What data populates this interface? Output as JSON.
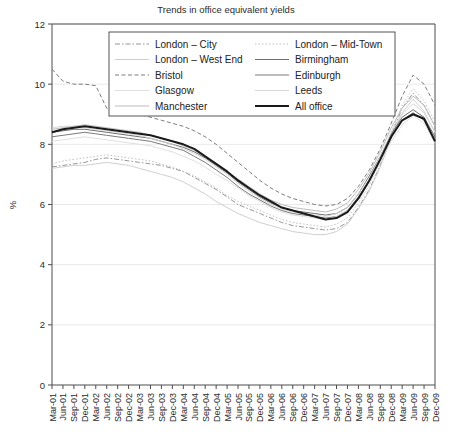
{
  "chart_data": {
    "type": "line",
    "title": "Trends in office equivalent yields",
    "xlabel": "",
    "ylabel": "%",
    "ylim": [
      0,
      12
    ],
    "yticks": [
      0,
      2,
      4,
      6,
      8,
      10,
      12
    ],
    "grid": true,
    "legend_position": "top-center",
    "categories": [
      "Mar-01",
      "Jun-01",
      "Sep-01",
      "Dec-01",
      "Mar-02",
      "Jun-02",
      "Sep-02",
      "Dec-02",
      "Mar-03",
      "Jun-03",
      "Sep-03",
      "Dec-03",
      "Mar-04",
      "Jun-04",
      "Sep-04",
      "Dec-04",
      "Mar-05",
      "Jun-05",
      "Sep-05",
      "Dec-05",
      "Mar-06",
      "Jun-06",
      "Sep-06",
      "Dec-06",
      "Mar-07",
      "Jun-07",
      "Sep-07",
      "Dec-07",
      "Mar-08",
      "Jun-08",
      "Sep-08",
      "Dec-08",
      "Mar-09",
      "Jun-09",
      "Sep-09",
      "Dec-09"
    ],
    "series": [
      {
        "name": "London – City",
        "style": "dashdot",
        "color": "#8a8a8a",
        "width": 0.9,
        "values": [
          7.25,
          7.3,
          7.35,
          7.4,
          7.5,
          7.55,
          7.5,
          7.45,
          7.4,
          7.35,
          7.3,
          7.2,
          7.1,
          6.9,
          6.7,
          6.5,
          6.25,
          6.0,
          5.85,
          5.7,
          5.55,
          5.4,
          5.3,
          5.25,
          5.2,
          5.15,
          5.2,
          5.4,
          5.9,
          6.5,
          7.3,
          8.3,
          9.2,
          9.7,
          9.3,
          8.6
        ]
      },
      {
        "name": "London – Mid-Town",
        "style": "dotted",
        "color": "#b8b8b8",
        "width": 0.9,
        "values": [
          7.35,
          7.45,
          7.5,
          7.55,
          7.6,
          7.65,
          7.6,
          7.55,
          7.5,
          7.45,
          7.35,
          7.25,
          7.1,
          6.95,
          6.75,
          6.55,
          6.3,
          6.1,
          5.95,
          5.8,
          5.65,
          5.5,
          5.4,
          5.35,
          5.3,
          5.25,
          5.35,
          5.55,
          6.05,
          6.65,
          7.45,
          8.4,
          9.3,
          9.85,
          9.45,
          8.75
        ]
      },
      {
        "name": "London – West End",
        "style": "solid",
        "color": "#c9c9c9",
        "width": 0.9,
        "values": [
          7.2,
          7.25,
          7.3,
          7.3,
          7.35,
          7.4,
          7.35,
          7.3,
          7.2,
          7.1,
          7.0,
          6.9,
          6.75,
          6.55,
          6.35,
          6.1,
          5.9,
          5.7,
          5.55,
          5.4,
          5.3,
          5.2,
          5.1,
          5.05,
          5.0,
          5.0,
          5.1,
          5.35,
          5.85,
          6.45,
          7.25,
          8.2,
          9.05,
          9.5,
          9.1,
          8.4
        ]
      },
      {
        "name": "Birmingham",
        "style": "solid",
        "color": "#6e6e6e",
        "width": 1.0,
        "values": [
          8.4,
          8.45,
          8.5,
          8.5,
          8.45,
          8.4,
          8.35,
          8.3,
          8.25,
          8.2,
          8.1,
          8.0,
          7.9,
          7.75,
          7.55,
          7.3,
          7.05,
          6.75,
          6.5,
          6.25,
          6.05,
          5.9,
          5.8,
          5.75,
          5.7,
          5.65,
          5.7,
          5.9,
          6.35,
          6.95,
          7.6,
          8.35,
          8.9,
          9.15,
          8.9,
          8.25
        ]
      },
      {
        "name": "Bristol",
        "style": "dashed",
        "color": "#7d7d7d",
        "width": 1.0,
        "values": [
          10.5,
          10.1,
          10.0,
          10.0,
          9.95,
          9.2,
          9.1,
          9.05,
          9.0,
          8.9,
          8.8,
          8.7,
          8.6,
          8.45,
          8.25,
          8.0,
          7.7,
          7.4,
          7.1,
          6.8,
          6.55,
          6.35,
          6.2,
          6.1,
          6.0,
          5.95,
          6.0,
          6.2,
          6.6,
          7.15,
          7.85,
          8.7,
          9.6,
          10.3,
          10.0,
          9.3
        ]
      },
      {
        "name": "Edinburgh",
        "style": "solid",
        "color": "#7a7a7a",
        "width": 1.0,
        "values": [
          8.25,
          8.3,
          8.35,
          8.4,
          8.35,
          8.3,
          8.25,
          8.2,
          8.15,
          8.1,
          8.0,
          7.9,
          7.8,
          7.6,
          7.4,
          7.15,
          6.9,
          6.6,
          6.35,
          6.15,
          5.95,
          5.8,
          5.7,
          5.65,
          5.6,
          5.55,
          5.6,
          5.8,
          6.25,
          6.8,
          7.5,
          8.25,
          8.8,
          9.05,
          8.8,
          8.15
        ]
      },
      {
        "name": "Glasgow",
        "style": "solid",
        "color": "#dcdcdc",
        "width": 0.9,
        "values": [
          8.1,
          8.15,
          8.2,
          8.25,
          8.2,
          8.15,
          8.1,
          8.05,
          8.0,
          7.95,
          7.85,
          7.75,
          7.6,
          7.45,
          7.25,
          7.0,
          6.8,
          6.55,
          6.3,
          6.1,
          5.9,
          5.75,
          5.65,
          5.6,
          5.55,
          5.5,
          5.6,
          5.8,
          6.2,
          6.75,
          7.4,
          8.1,
          8.65,
          8.95,
          8.7,
          8.05
        ]
      },
      {
        "name": "Leeds",
        "style": "solid",
        "color": "#d2d2d2",
        "width": 0.9,
        "values": [
          8.55,
          8.6,
          8.6,
          8.55,
          8.5,
          8.45,
          8.4,
          8.35,
          8.3,
          8.2,
          8.1,
          8.0,
          7.85,
          7.7,
          7.5,
          7.25,
          7.0,
          6.7,
          6.45,
          6.2,
          6.0,
          5.85,
          5.75,
          5.7,
          5.65,
          5.6,
          5.7,
          5.9,
          6.35,
          6.9,
          7.6,
          8.4,
          9.0,
          9.35,
          9.05,
          8.4
        ]
      },
      {
        "name": "Manchester",
        "style": "solid",
        "color": "#bdbdbd",
        "width": 1.0,
        "values": [
          8.5,
          8.55,
          8.6,
          8.65,
          8.6,
          8.55,
          8.5,
          8.45,
          8.4,
          8.3,
          8.2,
          8.1,
          7.95,
          7.8,
          7.6,
          7.35,
          7.1,
          6.85,
          6.6,
          6.35,
          6.15,
          6.0,
          5.9,
          5.85,
          5.8,
          5.75,
          5.85,
          6.05,
          6.5,
          7.05,
          7.75,
          8.55,
          9.2,
          9.6,
          9.3,
          8.6
        ]
      },
      {
        "name": "All office",
        "style": "solid",
        "color": "#1a1a1a",
        "width": 2.0,
        "values": [
          8.4,
          8.5,
          8.55,
          8.6,
          8.55,
          8.5,
          8.45,
          8.4,
          8.35,
          8.3,
          8.2,
          8.1,
          8.0,
          7.85,
          7.6,
          7.35,
          7.1,
          6.8,
          6.55,
          6.3,
          6.1,
          5.9,
          5.8,
          5.7,
          5.6,
          5.5,
          5.55,
          5.75,
          6.2,
          6.8,
          7.5,
          8.25,
          8.8,
          9.0,
          8.85,
          8.1
        ]
      }
    ],
    "legend_order": [
      "London – City",
      "London – Mid-Town",
      "London – West End",
      "Birmingham",
      "Bristol",
      "Edinburgh",
      "Glasgow",
      "Leeds",
      "Manchester",
      "All office"
    ]
  }
}
